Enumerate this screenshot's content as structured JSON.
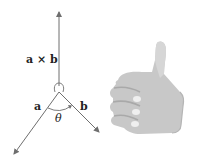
{
  "diagram": {
    "labels": {
      "cross_product": "a × b",
      "vector_a": "a",
      "vector_b": "b",
      "angle": "θ"
    },
    "colors": {
      "line": "#6e6e6e",
      "text": "#222222",
      "hand": "#c8c8c8",
      "hand_shadow": "#a9a9a9",
      "hand_highlight": "#efefef"
    },
    "illustration": "right-hand-thumbs-up"
  }
}
